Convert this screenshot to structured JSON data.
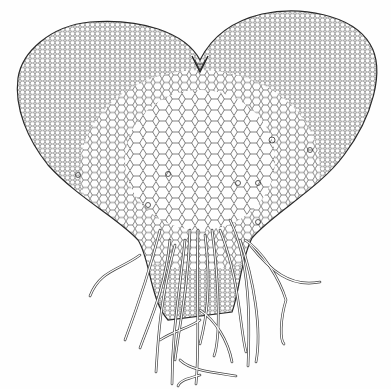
{
  "figure": {
    "background": "#fefefe",
    "ink": "#2a2a2a",
    "parts": [
      "thallus-body",
      "apical-notch",
      "cell-mesh",
      "rhizoids"
    ]
  }
}
